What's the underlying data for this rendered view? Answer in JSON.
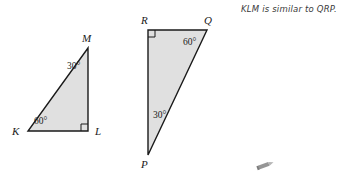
{
  "page": {
    "background_color": "#ffffff",
    "width": 346,
    "height": 191
  },
  "style": {
    "triangle_fill": "#e0e0e0",
    "triangle_stroke": "#1a1a1a",
    "text_color": "#1a1a1a",
    "note_color": "#3a3a3a",
    "pencil_color": "#6e6e6e"
  },
  "figures": [
    {
      "name": "triangle-klm",
      "vertices": [
        {
          "label": "M",
          "x": 88,
          "y": 48,
          "label_x": 82,
          "label_y": 33
        },
        {
          "label": "K",
          "x": 28,
          "y": 131,
          "label_x": 12,
          "label_y": 126
        },
        {
          "label": "L",
          "x": 88,
          "y": 131,
          "label_x": 95,
          "label_y": 126
        }
      ],
      "angles": [
        {
          "at": "M",
          "value": "30°",
          "label_x": 67,
          "label_y": 62
        },
        {
          "at": "K",
          "value": "60°",
          "label_x": 34,
          "label_y": 117
        },
        {
          "at": "L",
          "value": "right",
          "marker": "square"
        }
      ]
    },
    {
      "name": "triangle-pqr",
      "vertices": [
        {
          "label": "R",
          "x": 148,
          "y": 30,
          "label_x": 141,
          "label_y": 15
        },
        {
          "label": "Q",
          "x": 207,
          "y": 30,
          "label_x": 204,
          "label_y": 15
        },
        {
          "label": "P",
          "x": 148,
          "y": 155,
          "label_x": 141,
          "label_y": 159
        }
      ],
      "angles": [
        {
          "at": "Q",
          "value": "60°",
          "label_x": 183,
          "label_y": 38
        },
        {
          "at": "P",
          "value": "30°",
          "label_x": 153,
          "label_y": 111
        },
        {
          "at": "R",
          "value": "right",
          "marker": "square"
        }
      ]
    }
  ],
  "annotation": {
    "similarity_statement": "KLM is similar to QRP."
  },
  "decorations": {
    "pencil_icon": "pencil-icon"
  }
}
